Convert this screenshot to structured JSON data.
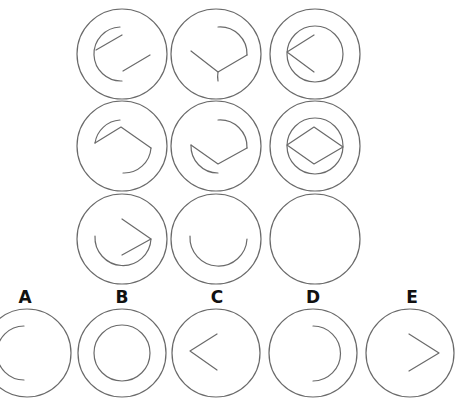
{
  "puzzle": {
    "type": "matrix-completion",
    "grid_rows": 3,
    "grid_cols": 3,
    "missing_cell": "row3-col3",
    "cells": [
      {
        "id": "r1c1",
        "content": "outer circle, left inner arc with two separate diagonal lines"
      },
      {
        "id": "r1c2",
        "content": "outer circle, right inner arc with downward V"
      },
      {
        "id": "r1c3",
        "content": "outer circle, full inner circle with left-pointing chevron"
      },
      {
        "id": "r2c1",
        "content": "outer circle, inner arc with upward wedge"
      },
      {
        "id": "r2c2",
        "content": "outer circle, inner arc with downward V"
      },
      {
        "id": "r2c3",
        "content": "outer circle, full inner circle with diamond"
      },
      {
        "id": "r3c1",
        "content": "outer circle, lower inner arc with right-pointing chevron"
      },
      {
        "id": "r3c2",
        "content": "outer circle, lower inner arc (U shape)"
      },
      {
        "id": "r3c3",
        "content": "outer circle, empty (missing)"
      }
    ]
  },
  "options": [
    {
      "label": "A",
      "content": "outer circle with left inner arc"
    },
    {
      "label": "B",
      "content": "outer circle with full inner circle"
    },
    {
      "label": "C",
      "content": "outer circle with left-pointing chevron"
    },
    {
      "label": "D",
      "content": "outer circle with right inner arc"
    },
    {
      "label": "E",
      "content": "outer circle with right-pointing chevron"
    }
  ],
  "colors": {
    "stroke": "#6a6a6a",
    "label": "#111111",
    "background": "#ffffff"
  }
}
